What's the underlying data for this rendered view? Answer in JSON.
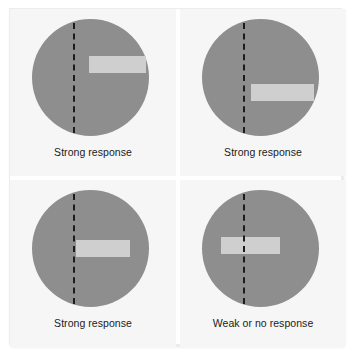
{
  "figure": {
    "title": "",
    "background_color": "#ffffff",
    "plate_background": "#f6f6f6"
  },
  "colors": {
    "receptive_field": "#8e8e8e",
    "stimulus_bar": "#cfcfcf",
    "axis_line": "#1c1c1c",
    "caption_text": "#1b1b1b",
    "panel_background": "#f6f6f6",
    "gutter": "#ffffff"
  },
  "panels": [
    {
      "id": "panel-1",
      "caption": "Strong response",
      "circle_name": "receptive-field-circle",
      "axis_name": "preferred-orientation-axis",
      "bar_name": "stimulus-bar",
      "bar_orientation": "horizontal",
      "bar_position": "right-of-axis-upper"
    },
    {
      "id": "panel-2",
      "caption": "Strong response",
      "circle_name": "receptive-field-circle",
      "axis_name": "preferred-orientation-axis",
      "bar_name": "stimulus-bar",
      "bar_orientation": "horizontal",
      "bar_position": "right-of-axis-lower"
    },
    {
      "id": "panel-3",
      "caption": "Strong response",
      "circle_name": "receptive-field-circle",
      "axis_name": "preferred-orientation-axis",
      "bar_name": "stimulus-bar",
      "bar_orientation": "horizontal",
      "bar_position": "right-of-axis-center"
    },
    {
      "id": "panel-4",
      "caption": "Weak or no response",
      "circle_name": "receptive-field-circle",
      "axis_name": "preferred-orientation-axis",
      "bar_name": "stimulus-bar",
      "bar_orientation": "horizontal",
      "bar_position": "crossing-axis-left"
    }
  ]
}
